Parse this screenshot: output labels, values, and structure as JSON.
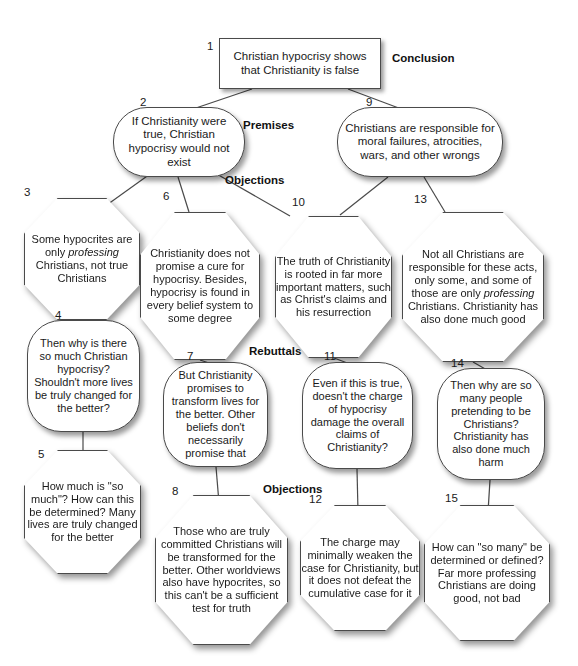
{
  "diagram": {
    "background": "#ffffff",
    "stroke_color": "#4a4a4a",
    "text_color": "#1a1a1a"
  },
  "section_labels": [
    {
      "id": "conclusion",
      "text": "Conclusion",
      "x": 392,
      "y": 52
    },
    {
      "id": "premises",
      "text": "Premises",
      "x": 243,
      "y": 119
    },
    {
      "id": "objections-top",
      "text": "Objections",
      "x": 225,
      "y": 174
    },
    {
      "id": "rebuttals",
      "text": "Rebuttals",
      "x": 249,
      "y": 345
    },
    {
      "id": "objections-bottom",
      "text": "Objections",
      "x": 263,
      "y": 483
    }
  ],
  "nodes": [
    {
      "num": "1",
      "name": "node-1-conclusion",
      "shape": "rect",
      "text": "Christian hypocrisy shows that Christianity is false",
      "x": 219,
      "y": 38,
      "w": 162,
      "h": 51,
      "font": 11.5,
      "num_x": 207,
      "num_y": 40
    },
    {
      "num": "2",
      "name": "node-2-premise",
      "shape": "round",
      "text": "If Christianity were true, Christian hypocrisy would not exist",
      "x": 113,
      "y": 107,
      "w": 132,
      "h": 70,
      "font": 11.5,
      "num_x": 140,
      "num_y": 96
    },
    {
      "num": "9",
      "name": "node-9-premise",
      "shape": "round",
      "text": "Christians are responsible for moral failures, atrocities, wars, and other wrongs",
      "x": 337,
      "y": 107,
      "w": 166,
      "h": 70,
      "font": 11.5,
      "num_x": 366,
      "num_y": 96
    },
    {
      "num": "3",
      "name": "node-3-objection",
      "shape": "oct",
      "text": "Some hypocrites are only |professing| Christians, not true Christians",
      "x": 24,
      "y": 198,
      "w": 116,
      "h": 122,
      "font": 11,
      "num_x": 24,
      "num_y": 186
    },
    {
      "num": "6",
      "name": "node-6-objection",
      "shape": "oct",
      "text": "Christianity does not promise a cure for hypocrisy. Besides, hypocrisy is found in every belief system to some degree",
      "x": 140,
      "y": 212,
      "w": 120,
      "h": 148,
      "font": 11,
      "num_x": 163,
      "num_y": 190
    },
    {
      "num": "10",
      "name": "node-10-objection",
      "shape": "oct",
      "text": "The truth of Christianity is rooted in far more important matters, such as Christ's claims and his resurrection",
      "x": 275,
      "y": 216,
      "w": 117,
      "h": 142,
      "font": 11,
      "num_x": 292,
      "num_y": 196
    },
    {
      "num": "13",
      "name": "node-13-objection",
      "shape": "oct",
      "text": "Not all Christians are responsible for these acts, only some, and some of those are only |professing| Christians. Christianity has also done much good",
      "x": 402,
      "y": 212,
      "w": 142,
      "h": 150,
      "font": 11,
      "num_x": 414,
      "num_y": 193
    },
    {
      "num": "4",
      "name": "node-4-rebuttal",
      "shape": "round",
      "text": "Then why is there so much Christian hypocrisy? Shouldn't more lives be truly changed for the better?",
      "x": 27,
      "y": 320,
      "w": 113,
      "h": 112,
      "font": 11,
      "num_x": 55,
      "num_y": 309
    },
    {
      "num": "7",
      "name": "node-7-rebuttal",
      "shape": "round",
      "text": "But Christianity promises to transform lives for the better. Other beliefs don't necessarily promise that",
      "x": 163,
      "y": 362,
      "w": 105,
      "h": 105,
      "font": 11,
      "num_x": 187,
      "num_y": 350
    },
    {
      "num": "11",
      "name": "node-11-rebuttal",
      "shape": "round",
      "text": "Even if this is true, doesn't the charge of hypocrisy damage the overall claims of Christianity?",
      "x": 302,
      "y": 362,
      "w": 111,
      "h": 107,
      "font": 11,
      "num_x": 324,
      "num_y": 350
    },
    {
      "num": "14",
      "name": "node-14-rebuttal",
      "shape": "round",
      "text": "Then why are so many people pretending to be Christians? Christianity has also done much harm",
      "x": 437,
      "y": 368,
      "w": 108,
      "h": 112,
      "font": 11,
      "num_x": 451,
      "num_y": 357
    },
    {
      "num": "5",
      "name": "node-5-objection",
      "shape": "oct",
      "text": "How much is \"so much\"? How can this be determined? Many lives are truly changed for the better",
      "x": 24,
      "y": 450,
      "w": 117,
      "h": 124,
      "font": 11,
      "num_x": 38,
      "num_y": 448
    },
    {
      "num": "8",
      "name": "node-8-objection",
      "shape": "oct",
      "text": "Those who are truly committed Christians will be transformed for the better. Other worldviews also have hypocrites, so this can't be a sufficient test for truth",
      "x": 155,
      "y": 495,
      "w": 133,
      "h": 150,
      "font": 11,
      "num_x": 172,
      "num_y": 485
    },
    {
      "num": "12",
      "name": "node-12-objection",
      "shape": "oct",
      "text": "The charge may minimally weaken the case for Christianity, but it does not defeat the cumulative case for it",
      "x": 300,
      "y": 505,
      "w": 120,
      "h": 126,
      "font": 11,
      "num_x": 309,
      "num_y": 493
    },
    {
      "num": "15",
      "name": "node-15-objection",
      "shape": "oct",
      "text": "How can \"so many\" be determined or defined? Far more professing Christians are doing good, not bad",
      "x": 424,
      "y": 505,
      "w": 126,
      "h": 136,
      "font": 11,
      "num_x": 445,
      "num_y": 492
    }
  ],
  "edges": [
    {
      "from": "1",
      "to": "2",
      "x1": 252,
      "y1": 89,
      "x2": 190,
      "y2": 110
    },
    {
      "from": "1",
      "to": "9",
      "x1": 348,
      "y1": 89,
      "x2": 404,
      "y2": 110
    },
    {
      "from": "2",
      "to": "3",
      "x1": 150,
      "y1": 174,
      "x2": 104,
      "y2": 207
    },
    {
      "from": "2",
      "to": "6",
      "x1": 178,
      "y1": 177,
      "x2": 189,
      "y2": 212
    },
    {
      "from": "2",
      "to": "10",
      "x1": 215,
      "y1": 173,
      "x2": 290,
      "y2": 216
    },
    {
      "from": "9",
      "to": "10",
      "x1": 388,
      "y1": 177,
      "x2": 340,
      "y2": 215
    },
    {
      "from": "9",
      "to": "13",
      "x1": 424,
      "y1": 177,
      "x2": 445,
      "y2": 212
    },
    {
      "from": "3",
      "to": "4",
      "x1": 82,
      "y1": 320,
      "x2": 82,
      "y2": 324
    },
    {
      "from": "6",
      "to": "7",
      "x1": 200,
      "y1": 360,
      "x2": 212,
      "y2": 364
    },
    {
      "from": "10",
      "to": "11",
      "x1": 334,
      "y1": 358,
      "x2": 350,
      "y2": 364
    },
    {
      "from": "13",
      "to": "14",
      "x1": 473,
      "y1": 362,
      "x2": 487,
      "y2": 370
    },
    {
      "from": "4",
      "to": "5",
      "x1": 83,
      "y1": 432,
      "x2": 83,
      "y2": 458
    },
    {
      "from": "7",
      "to": "8",
      "x1": 216,
      "y1": 467,
      "x2": 219,
      "y2": 503
    },
    {
      "from": "11",
      "to": "12",
      "x1": 357,
      "y1": 469,
      "x2": 358,
      "y2": 512
    },
    {
      "from": "14",
      "to": "15",
      "x1": 490,
      "y1": 480,
      "x2": 488,
      "y2": 512
    }
  ]
}
